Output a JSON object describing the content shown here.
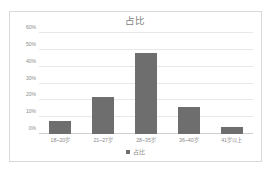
{
  "chart_data": {
    "type": "bar",
    "title": "占比",
    "xlabel": "",
    "ylabel": "",
    "categories": [
      "18~20岁",
      "21~27岁",
      "28~35岁",
      "36~40岁",
      "41岁以上"
    ],
    "values": [
      8,
      22,
      48,
      16,
      4
    ],
    "series": [
      {
        "name": "占比",
        "values": [
          8,
          22,
          48,
          16,
          4
        ]
      }
    ],
    "ylim": [
      0,
      60
    ],
    "ytick_values": [
      0,
      10,
      20,
      30,
      40,
      50,
      60
    ],
    "ytick_labels": [
      "0%",
      "10%",
      "20%",
      "30%",
      "40%",
      "50%",
      "60%"
    ],
    "grid": true,
    "legend": {
      "position": "bottom",
      "entries": [
        "占比"
      ]
    },
    "colors": {
      "bar": "#6e6e6e",
      "gridline": "#e8e8e8",
      "axis_text": "#8a8a8a",
      "title_text": "#7f7f7f",
      "border": "#d9d9d9",
      "background": "#ffffff"
    }
  }
}
